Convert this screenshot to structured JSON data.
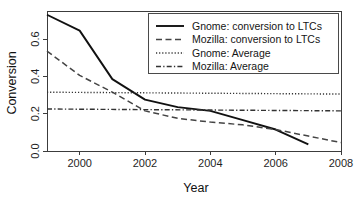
{
  "chart_data": {
    "type": "line",
    "title": "",
    "xlabel": "Year",
    "ylabel": "Conversion",
    "xlim": [
      1999,
      2008
    ],
    "ylim": [
      0.0,
      0.75
    ],
    "grid": false,
    "legend_position": "top-right",
    "x_ticks": [
      "2000",
      "2002",
      "2004",
      "2006",
      "2008"
    ],
    "x_tick_values": [
      2000,
      2002,
      2004,
      2006,
      2008
    ],
    "y_ticks": [
      "0.0",
      "0.2",
      "0.4",
      "0.6"
    ],
    "y_tick_values": [
      0.0,
      0.2,
      0.4,
      0.6
    ],
    "series": [
      {
        "name": "Gnome: conversion to LTCs",
        "style": "solid",
        "color": "#111111",
        "width": 1.9,
        "x": [
          1999,
          2000,
          2001,
          2002,
          2003,
          2004,
          2005,
          2006,
          2007
        ],
        "values": [
          0.73,
          0.645,
          0.385,
          0.275,
          0.235,
          0.215,
          0.165,
          0.115,
          0.035
        ]
      },
      {
        "name": "Mozilla: conversion to LTCs",
        "style": "dashed",
        "color": "#444444",
        "width": 1.5,
        "x": [
          1999,
          2000,
          2001,
          2002,
          2003,
          2004,
          2005,
          2006,
          2007,
          2008
        ],
        "values": [
          0.535,
          0.405,
          0.315,
          0.215,
          0.175,
          0.155,
          0.14,
          0.115,
          0.08,
          0.045
        ]
      },
      {
        "name": "Gnome: Average",
        "style": "dotted",
        "color": "#333333",
        "width": 1.4,
        "x": [
          1999,
          2008
        ],
        "values": [
          0.315,
          0.305
        ]
      },
      {
        "name": "Mozilla: Average",
        "style": "dashdot",
        "color": "#333333",
        "width": 1.4,
        "x": [
          1999,
          2008
        ],
        "values": [
          0.225,
          0.215
        ]
      }
    ],
    "legend_entries": [
      {
        "label": "Gnome: conversion to LTCs",
        "style": "solid"
      },
      {
        "label": "Mozilla: conversion to LTCs",
        "style": "dashed"
      },
      {
        "label": "Gnome: Average",
        "style": "dotted"
      },
      {
        "label": "Mozilla: Average",
        "style": "dashdot"
      }
    ]
  }
}
